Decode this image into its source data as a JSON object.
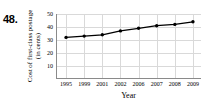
{
  "figure": {
    "problem_number": "48.",
    "ylabel_line1": "Cost of first-class postage",
    "ylabel_line2": "(in cents)",
    "xlabel": "Year"
  },
  "chart_data": {
    "type": "line",
    "title": "",
    "xlabel": "Year",
    "ylabel": "Cost of first-class postage (in cents)",
    "categories": [
      "1995",
      "1999",
      "2001",
      "2002",
      "2006",
      "2007",
      "2008",
      "2009"
    ],
    "values": [
      32,
      33,
      34,
      37,
      39,
      41,
      42,
      44
    ],
    "ylim": [
      0,
      50
    ],
    "yticks": [
      10,
      20,
      30,
      40,
      50
    ],
    "grid": true,
    "legend": false,
    "marker": "filled-circle",
    "line_color": "#000000",
    "grid_color": "#d9d9d9",
    "axis_color": "#8a8a8a"
  }
}
